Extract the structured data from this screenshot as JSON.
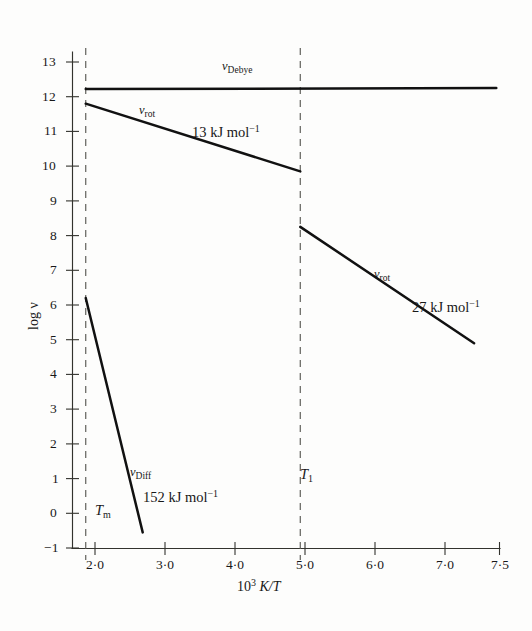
{
  "chart_data": {
    "type": "line",
    "title": "",
    "xlabel": "10³ K/T",
    "ylabel": "log ν",
    "xlim": [
      1.71,
      7.5
    ],
    "ylim": [
      -1,
      13.4
    ],
    "grid": false,
    "legend": "inline-annotations",
    "x_ticks": [
      "2·0",
      "3·0",
      "4·0",
      "5·0",
      "6·0",
      "7·0",
      "7·5"
    ],
    "x_tick_values": [
      2.0,
      3.0,
      4.0,
      5.0,
      6.0,
      7.0,
      7.5
    ],
    "y_ticks": [
      "13",
      "12",
      "11",
      "10",
      "9",
      "8",
      "7",
      "6",
      "5",
      "4",
      "3",
      "2",
      "1",
      "0",
      "−1"
    ],
    "y_tick_values": [
      13,
      12,
      11,
      10,
      9,
      8,
      7,
      6,
      5,
      4,
      3,
      2,
      1,
      0,
      -1
    ],
    "series": [
      {
        "name": "nu-debye",
        "label": "ν",
        "label_sub": "Debye",
        "points": [
          [
            1.9,
            12.22
          ],
          [
            7.45,
            12.25
          ]
        ]
      },
      {
        "name": "nu-rot-low-temp-branch",
        "label": "ν",
        "label_sub": "rot",
        "points": [
          [
            1.9,
            11.8
          ],
          [
            4.8,
            9.85
          ]
        ],
        "activation_energy": "13 kJ mol",
        "activation_energy_exp": "−1"
      },
      {
        "name": "nu-rot-high-temp-branch",
        "label": "ν",
        "label_sub": "rot",
        "points": [
          [
            4.8,
            8.25
          ],
          [
            7.15,
            4.9
          ]
        ],
        "activation_energy": "27 kJ mol",
        "activation_energy_exp": "−1"
      },
      {
        "name": "nu-diff",
        "label": "ν",
        "label_sub": "Diff",
        "points": [
          [
            1.9,
            6.2
          ],
          [
            2.67,
            -0.55
          ]
        ],
        "activation_energy": "152 kJ mol",
        "activation_energy_exp": "−1"
      }
    ],
    "vertical_markers": [
      {
        "name": "T-melting",
        "x": 1.9,
        "label": "T",
        "label_sub": "m"
      },
      {
        "name": "T-transition",
        "x": 4.8,
        "label": "T",
        "label_sub": "1"
      }
    ],
    "annotations": [
      {
        "name": "debye-label",
        "text": "ν",
        "sub": "Debye",
        "x": 4.0,
        "y": 12.85
      },
      {
        "name": "rot-low-label",
        "text": "ν",
        "sub": "rot",
        "x": 2.55,
        "y": 11.6
      },
      {
        "name": "energy-13",
        "text": "13 kJ mol",
        "sup": "−1",
        "x": 3.45,
        "y": 11.1
      },
      {
        "name": "rot-high-label",
        "text": "ν",
        "sub": "rot",
        "x": 6.0,
        "y": 6.85
      },
      {
        "name": "energy-27",
        "text": "27 kJ mol",
        "sup": "−1",
        "x": 6.55,
        "y": 5.85
      },
      {
        "name": "diff-label",
        "text": "ν",
        "sub": "Diff",
        "x": 2.38,
        "y": 1.95
      },
      {
        "name": "energy-152",
        "text": "152 kJ mol",
        "sup": "−1",
        "x": 2.72,
        "y": 1.05
      }
    ]
  },
  "axes": {
    "x_axis_title_prefix": "10",
    "x_axis_title_sup": "3",
    "x_axis_title_suffix": "K/T",
    "y_axis_title": "log ν"
  }
}
